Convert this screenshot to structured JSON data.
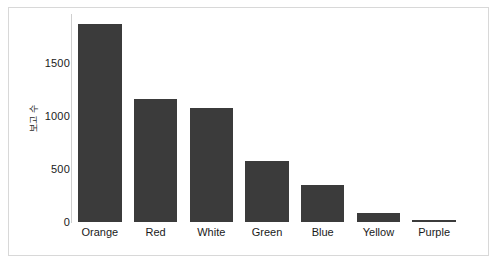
{
  "chart_data": {
    "type": "bar",
    "title": "",
    "subtitle": "",
    "xlabel": "",
    "ylabel": "보고 수",
    "categories": [
      "Orange",
      "Red",
      "White",
      "Green",
      "Blue",
      "Yellow",
      "Purple"
    ],
    "values": [
      1870,
      1160,
      1070,
      575,
      350,
      85,
      5
    ],
    "series": [
      {
        "name": "보고 수",
        "values": [
          1870,
          1160,
          1070,
          575,
          350,
          85,
          5
        ]
      }
    ],
    "ylim": [
      0,
      1960
    ],
    "xlim": [
      0,
      7
    ],
    "y_ticks": [
      0,
      500,
      1000,
      1500
    ],
    "y_tick_labels": [
      "0",
      "500",
      "1000",
      "1500"
    ],
    "grid": false,
    "legend": null,
    "legend_position": "none",
    "bar_color": "#3b3b3b",
    "axis_color": "#cfcfcf",
    "text_color": "#1a1a1a",
    "background_color": "#ffffff",
    "frame_color": "#d8d8d8",
    "annotations": []
  },
  "figure": {
    "border_color": "#d8d8d8",
    "background": "#ffffff"
  }
}
